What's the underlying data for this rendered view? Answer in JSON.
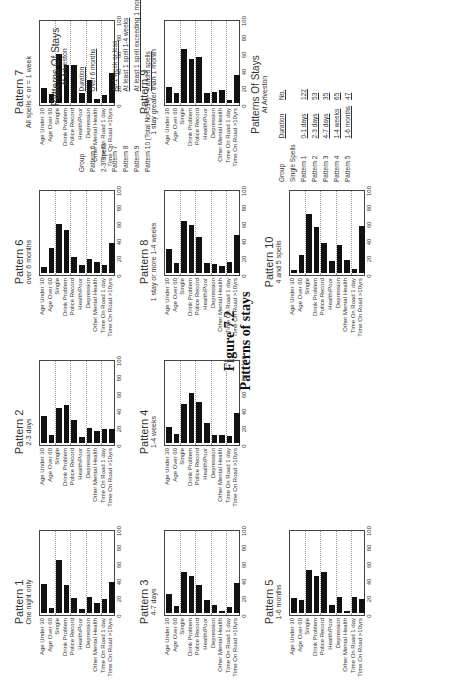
{
  "figure": {
    "number": "Figure 7.2",
    "title": "Patterns of stays"
  },
  "categories": [
    "Age Under 30",
    "Age Over 60",
    "Single",
    "Drink Problem",
    "Police Record",
    "Health/Poor",
    "Depression",
    "Other Mental Health",
    "Time On Road 1 day",
    "Time On Road >10yrs"
  ],
  "axis_ticks": [
    "0",
    "20",
    "40",
    "60",
    "80",
    "100"
  ],
  "chart_data": [
    {
      "type": "bar",
      "title": "Pattern 1",
      "subtitle": "One night only",
      "categories": [
        "Age Under 30",
        "Age Over 60",
        "Single",
        "Drink Problem",
        "Police Record",
        "Health/Poor",
        "Depression",
        "Other Mental Health",
        "Time On Road 1 day",
        "Time On Road >10yrs"
      ],
      "values": [
        35,
        6,
        65,
        34,
        18,
        5,
        19,
        12,
        17,
        38
      ],
      "ylim": [
        0,
        100
      ],
      "grid": true
    },
    {
      "type": "bar",
      "title": "Pattern 2",
      "subtitle": "2-3 days",
      "categories": [
        "Age Under 30",
        "Age Over 60",
        "Single",
        "Drink Problem",
        "Police Record",
        "Health/Poor",
        "Depression",
        "Other Mental Health",
        "Time On Road 1 day",
        "Time On Road >10yrs"
      ],
      "values": [
        33,
        10,
        43,
        46,
        28,
        7,
        18,
        15,
        17,
        17
      ],
      "ylim": [
        0,
        100
      ],
      "grid": true
    },
    {
      "type": "bar",
      "title": "Pattern 3",
      "subtitle": "4-7 days",
      "categories": [
        "Age Under 30",
        "Age Over 60",
        "Single",
        "Drink Problem",
        "Police Record",
        "Health/Poor",
        "Depression",
        "Other Mental Health",
        "Time On Road 1 day",
        "Time On Road >10yrs"
      ],
      "values": [
        23,
        9,
        50,
        45,
        34,
        16,
        10,
        3,
        7,
        37
      ],
      "ylim": [
        0,
        100
      ],
      "grid": true
    },
    {
      "type": "bar",
      "title": "Pattern 4",
      "subtitle": "1-4 weeks",
      "categories": [
        "Age Under 30",
        "Age Over 60",
        "Single",
        "Drink Problem",
        "Police Record",
        "Health/Poor",
        "Depression",
        "Other Mental Health",
        "Time On Road 1 day",
        "Time On Road >10yrs"
      ],
      "values": [
        20,
        11,
        48,
        61,
        50,
        24,
        10,
        10,
        8,
        37
      ],
      "ylim": [
        0,
        100
      ],
      "grid": true
    },
    {
      "type": "bar",
      "title": "Pattern 5",
      "subtitle": "1-6 months",
      "categories": [
        "Age Under 30",
        "Age Over 60",
        "Single",
        "Drink Problem",
        "Police Record",
        "Health/Poor",
        "Depression",
        "Other Mental Health",
        "Time On Road 1 day",
        "Time On Road >10yrs"
      ],
      "values": [
        18,
        16,
        53,
        45,
        50,
        10,
        19,
        3,
        19,
        17
      ],
      "ylim": [
        0,
        100
      ],
      "grid": true
    },
    {
      "type": "bar",
      "title": "Pattern 6",
      "subtitle": "over 6 months",
      "categories": [
        "Age Under 30",
        "Age Over 60",
        "Single",
        "Drink Problem",
        "Police Record",
        "Health/Poor",
        "Depression",
        "Other Mental Health",
        "Time On Road 1 day",
        "Time On Road >10yrs"
      ],
      "values": [
        7,
        31,
        60,
        52,
        20,
        10,
        17,
        14,
        10,
        37
      ],
      "ylim": [
        0,
        100
      ],
      "grid": true
    },
    {
      "type": "bar",
      "title": "Pattern 7",
      "subtitle": "All spells < or = 1 week",
      "categories": [
        "Age Under 30",
        "Age Over 60",
        "Single",
        "Drink Problem",
        "Police Record",
        "Health/Poor",
        "Depression",
        "Other Mental Health",
        "Time On Road 1 day",
        "Time On Road >10yrs"
      ],
      "values": [
        18,
        11,
        60,
        46,
        46,
        12,
        28,
        5,
        10,
        37
      ],
      "ylim": [
        0,
        100
      ],
      "grid": true
    },
    {
      "type": "bar",
      "title": "Pattern 8",
      "subtitle": "1 stay or more 1-4 weeks",
      "categories": [
        "Age Under 30",
        "Age Over 60",
        "Single",
        "Drink Problem",
        "Police Record",
        "Health/Poor",
        "Depression",
        "Other Mental Health",
        "Time On Road 1 day",
        "Time On Road >10yrs"
      ],
      "values": [
        29,
        12,
        63,
        58,
        44,
        12,
        11,
        8,
        14,
        46
      ],
      "ylim": [
        0,
        100
      ],
      "grid": true
    },
    {
      "type": "bar",
      "title": "Pattern 9",
      "subtitle": "1 stay greater than 1 month",
      "categories": [
        "Age Under 30",
        "Age Over 60",
        "Single",
        "Drink Problem",
        "Police Record",
        "Health/Poor",
        "Depression",
        "Other Mental Health",
        "Time On Road 1 day",
        "Time On Road >10yrs"
      ],
      "values": [
        20,
        12,
        66,
        54,
        56,
        12,
        13,
        16,
        4,
        34
      ],
      "ylim": [
        0,
        100
      ],
      "grid": true
    },
    {
      "type": "bar",
      "title": "Pattern 10",
      "subtitle": "4 and 5 spells",
      "categories": [
        "Age Under 30",
        "Age Over 60",
        "Single",
        "Drink Problem",
        "Police Record",
        "Health/Poor",
        "Depression",
        "Other Mental Health",
        "Time On Road 1 day",
        "Time On Road >10yrs"
      ],
      "values": [
        4,
        22,
        72,
        56,
        37,
        15,
        34,
        16,
        5,
        57
      ],
      "ylim": [
        0,
        100
      ],
      "grid": true
    }
  ],
  "table_single": {
    "title": "Patterns Of Stays",
    "subtitle": "At Arlveston",
    "headers": [
      "Group",
      "Duration",
      "No."
    ],
    "section": "Single Spells",
    "rows": [
      [
        "Pattern 1",
        "0-1 days",
        "122"
      ],
      [
        "Pattern 2",
        "2-3 days",
        "53"
      ],
      [
        "Pattern 3",
        "4-7 days",
        "35"
      ],
      [
        "Pattern 4",
        "1-4 weeks",
        "65"
      ],
      [
        "Pattern 5",
        "1-6 months",
        "47"
      ]
    ]
  },
  "table_multi": {
    "title": "Patterns Of Stays",
    "subtitle": "At Arlveston",
    "headers": [
      "Group",
      "Duration",
      "No."
    ],
    "rows": [
      [
        "Pattern 6",
        "Over 6 months",
        "30"
      ],
      [
        "2-3 Spells",
        "",
        ""
      ],
      [
        "Pattern 7",
        "All 1 week or less",
        "56"
      ],
      [
        "Pattern 8",
        "At least 1 spell 1-4 weeks",
        "44"
      ],
      [
        "Pattern 9",
        "At least 1 spell exceeding 1 month",
        "35"
      ],
      [
        "Pattern 10 (Total No=514)",
        "4 and 5 spells",
        "27"
      ]
    ]
  }
}
